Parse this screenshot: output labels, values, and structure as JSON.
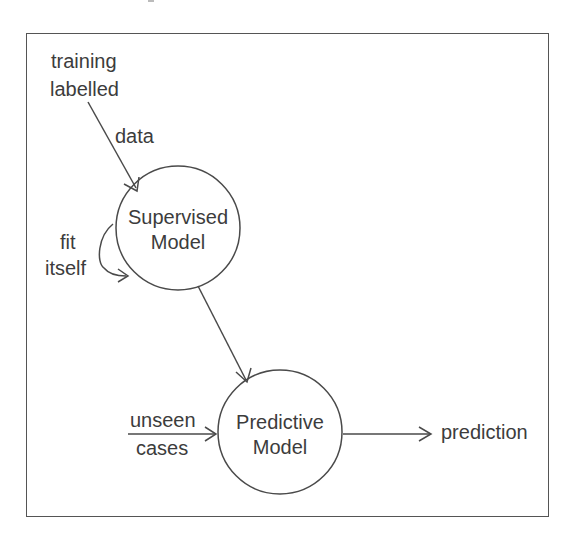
{
  "diagram": {
    "type": "flow",
    "nodes": {
      "supervised": {
        "line1": "Supervised",
        "line2": "Model"
      },
      "predictive": {
        "line1": "Predictive",
        "line2": "Model"
      }
    },
    "labels": {
      "training": "training",
      "labelled": "labelled",
      "data": "data",
      "fit": "fit",
      "itself": "itself",
      "unseen": "unseen",
      "cases": "cases",
      "prediction": "prediction"
    },
    "edges": [
      {
        "from": "training labelled data",
        "to": "Supervised Model"
      },
      {
        "from": "Supervised Model",
        "to": "Supervised Model",
        "label": "fit itself"
      },
      {
        "from": "Supervised Model",
        "to": "Predictive Model"
      },
      {
        "from": "unseen cases",
        "to": "Predictive Model"
      },
      {
        "from": "Predictive Model",
        "to": "prediction"
      }
    ],
    "colors": {
      "stroke": "#4a4a4a",
      "text": "#3c3c3c",
      "background": "#ffffff"
    }
  }
}
